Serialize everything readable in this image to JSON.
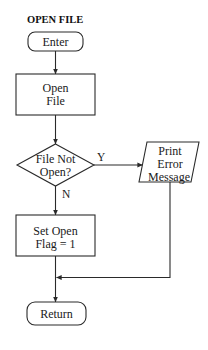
{
  "title": "OPEN FILE",
  "nodes": {
    "enter": {
      "shape": "terminator",
      "label": "Enter"
    },
    "open_file": {
      "shape": "process",
      "lines": [
        "Open",
        "File"
      ]
    },
    "decision": {
      "shape": "decision",
      "lines": [
        "File Not",
        "Open?"
      ]
    },
    "print_error": {
      "shape": "input-output",
      "lines": [
        "Print",
        "Error",
        "Message"
      ]
    },
    "set_flag": {
      "shape": "process",
      "lines": [
        "Set Open",
        "Flag = 1"
      ]
    },
    "return": {
      "shape": "terminator",
      "label": "Return"
    }
  },
  "edges": [
    {
      "from": "enter",
      "to": "open_file",
      "label": ""
    },
    {
      "from": "open_file",
      "to": "decision",
      "label": ""
    },
    {
      "from": "decision",
      "to": "print_error",
      "label": "Y"
    },
    {
      "from": "decision",
      "to": "set_flag",
      "label": "N"
    },
    {
      "from": "set_flag",
      "to": "return",
      "label": ""
    },
    {
      "from": "print_error",
      "to": "return",
      "label": ""
    }
  ],
  "edge_labels": {
    "yes": "Y",
    "no": "N"
  },
  "colors": {
    "background": "#ffffff",
    "stroke": "#2a2a2a",
    "text": "#1a1a1a"
  }
}
